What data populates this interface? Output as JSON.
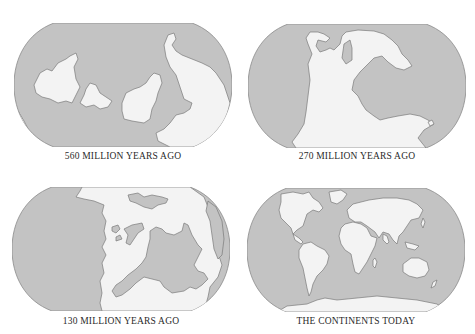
{
  "figure": {
    "ocean_color": "#c3c3c3",
    "land_color": "#f3f3f3",
    "panels": [
      {
        "id": "560ma",
        "caption": "560 MILLION YEARS AGO"
      },
      {
        "id": "270ma",
        "caption": "270 MILLION YEARS AGO"
      },
      {
        "id": "130ma",
        "caption": "130 MILLION YEARS AGO"
      },
      {
        "id": "today",
        "caption": "THE CONTINENTS TODAY"
      }
    ]
  }
}
